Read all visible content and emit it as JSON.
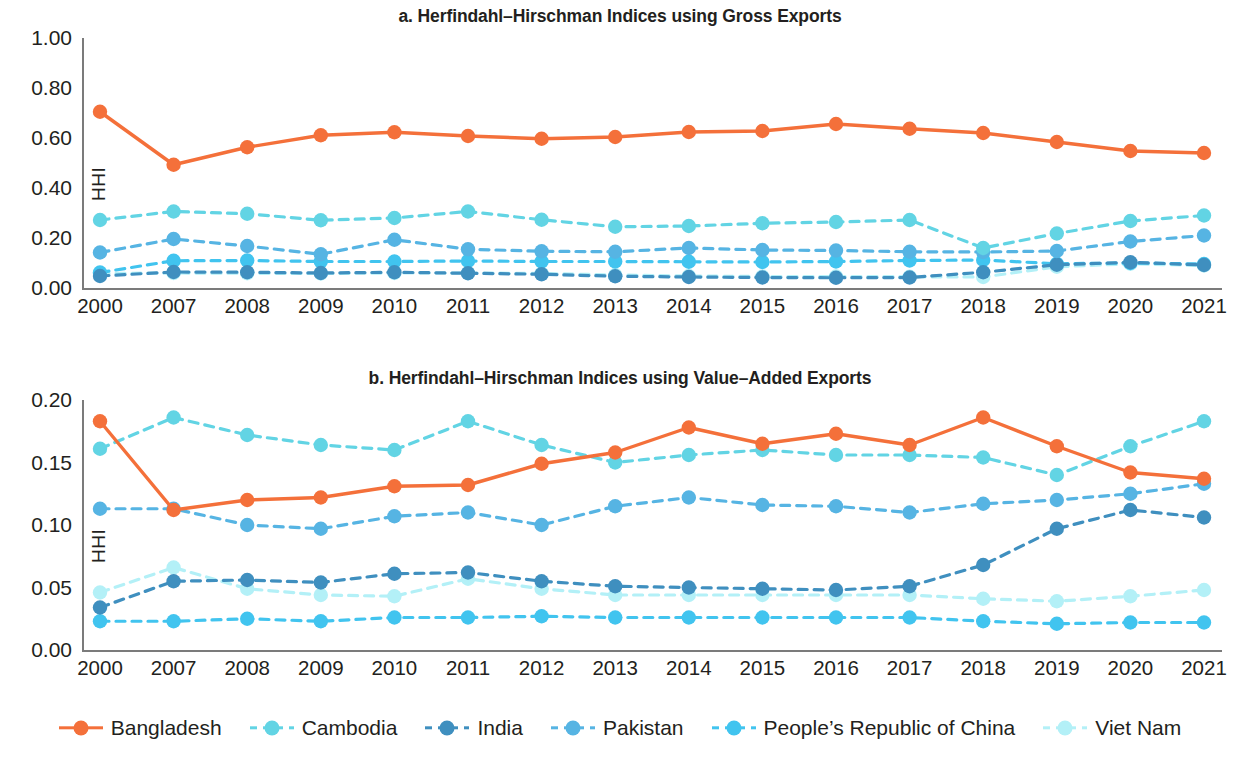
{
  "figure": {
    "ylabel": "HHI"
  },
  "legend": {
    "position": "bottom",
    "items": [
      {
        "label": "Bangladesh",
        "color": "#f4703a",
        "dashed": false
      },
      {
        "label": "Cambodia",
        "color": "#62d4e4",
        "dashed": true
      },
      {
        "label": "India",
        "color": "#3f8fbf",
        "dashed": true
      },
      {
        "label": "Pakistan",
        "color": "#56b4e3",
        "dashed": true
      },
      {
        "label": "People’s Republic of China",
        "color": "#41c4ef",
        "dashed": true
      },
      {
        "label": "Viet Nam",
        "color": "#b3f0f7",
        "dashed": true
      }
    ]
  },
  "chart_data": [
    {
      "id": "a",
      "type": "line",
      "title": "a. Herfindahl–Hirschman Indices using Gross Exports",
      "xlabel": "",
      "ylabel": "HHI",
      "grid": false,
      "ylim": [
        0.0,
        1.0
      ],
      "yticks": [
        "0.00",
        "0.20",
        "0.40",
        "0.60",
        "0.80",
        "1.00"
      ],
      "ytick_values": [
        0.0,
        0.2,
        0.4,
        0.6,
        0.8,
        1.0
      ],
      "categories": [
        "2000",
        "2007",
        "2008",
        "2009",
        "2010",
        "2011",
        "2012",
        "2013",
        "2014",
        "2015",
        "2016",
        "2017",
        "2018",
        "2019",
        "2020",
        "2021"
      ],
      "series": [
        {
          "name": "Bangladesh",
          "color": "#f4703a",
          "dashed": false,
          "values": [
            0.705,
            0.493,
            0.563,
            0.611,
            0.623,
            0.608,
            0.597,
            0.604,
            0.624,
            0.628,
            0.656,
            0.637,
            0.62,
            0.584,
            0.548,
            0.54
          ]
        },
        {
          "name": "Cambodia",
          "color": "#62d4e4",
          "dashed": true,
          "values": [
            0.272,
            0.306,
            0.297,
            0.271,
            0.28,
            0.306,
            0.273,
            0.245,
            0.248,
            0.259,
            0.264,
            0.272,
            0.16,
            0.218,
            0.268,
            0.29
          ]
        },
        {
          "name": "India",
          "color": "#3f8fbf",
          "dashed": true,
          "values": [
            0.048,
            0.064,
            0.063,
            0.06,
            0.063,
            0.059,
            0.055,
            0.047,
            0.044,
            0.042,
            0.041,
            0.042,
            0.063,
            0.093,
            0.103,
            0.092
          ]
        },
        {
          "name": "Pakistan",
          "color": "#56b4e3",
          "dashed": true,
          "values": [
            0.142,
            0.196,
            0.168,
            0.135,
            0.193,
            0.155,
            0.147,
            0.145,
            0.16,
            0.152,
            0.15,
            0.145,
            0.144,
            0.148,
            0.186,
            0.21
          ]
        },
        {
          "name": "People’s Republic of China",
          "color": "#41c4ef",
          "dashed": true,
          "values": [
            0.062,
            0.109,
            0.11,
            0.106,
            0.106,
            0.108,
            0.106,
            0.106,
            0.105,
            0.104,
            0.106,
            0.11,
            0.112,
            0.097,
            0.1,
            0.096
          ]
        },
        {
          "name": "Viet Nam",
          "color": "#b3f0f7",
          "dashed": true,
          "values": [
            0.058,
            0.06,
            0.059,
            0.058,
            0.06,
            0.06,
            0.058,
            0.052,
            0.048,
            0.046,
            0.046,
            0.045,
            0.044,
            0.085,
            0.097,
            0.09
          ]
        }
      ]
    },
    {
      "id": "b",
      "type": "line",
      "title": "b. Herfindahl–Hirschman Indices using Value–Added Exports",
      "xlabel": "",
      "ylabel": "HHI",
      "grid": false,
      "ylim": [
        0.0,
        0.2
      ],
      "yticks": [
        "0.00",
        "0.05",
        "0.10",
        "0.15",
        "0.20"
      ],
      "ytick_values": [
        0.0,
        0.05,
        0.1,
        0.15,
        0.2
      ],
      "categories": [
        "2000",
        "2007",
        "2008",
        "2009",
        "2010",
        "2011",
        "2012",
        "2013",
        "2014",
        "2015",
        "2016",
        "2017",
        "2018",
        "2019",
        "2020",
        "2021"
      ],
      "series": [
        {
          "name": "Bangladesh",
          "color": "#f4703a",
          "dashed": false,
          "values": [
            0.183,
            0.112,
            0.12,
            0.122,
            0.131,
            0.132,
            0.149,
            0.158,
            0.178,
            0.165,
            0.173,
            0.164,
            0.186,
            0.163,
            0.142,
            0.137
          ]
        },
        {
          "name": "Cambodia",
          "color": "#62d4e4",
          "dashed": true,
          "values": [
            0.161,
            0.186,
            0.172,
            0.164,
            0.16,
            0.183,
            0.164,
            0.15,
            0.156,
            0.16,
            0.156,
            0.156,
            0.154,
            0.14,
            0.163,
            0.183
          ]
        },
        {
          "name": "India",
          "color": "#3f8fbf",
          "dashed": true,
          "values": [
            0.034,
            0.055,
            0.056,
            0.054,
            0.061,
            0.062,
            0.055,
            0.051,
            0.05,
            0.049,
            0.048,
            0.051,
            0.068,
            0.097,
            0.112,
            0.106
          ]
        },
        {
          "name": "Pakistan",
          "color": "#56b4e3",
          "dashed": true,
          "values": [
            0.113,
            0.113,
            0.1,
            0.097,
            0.107,
            0.11,
            0.1,
            0.115,
            0.122,
            0.116,
            0.115,
            0.11,
            0.117,
            0.12,
            0.125,
            0.133
          ]
        },
        {
          "name": "People’s Republic of China",
          "color": "#41c4ef",
          "dashed": true,
          "values": [
            0.023,
            0.023,
            0.025,
            0.023,
            0.026,
            0.026,
            0.027,
            0.026,
            0.026,
            0.026,
            0.026,
            0.026,
            0.023,
            0.021,
            0.022,
            0.022
          ]
        },
        {
          "name": "Viet Nam",
          "color": "#b3f0f7",
          "dashed": true,
          "values": [
            0.046,
            0.066,
            0.049,
            0.044,
            0.043,
            0.057,
            0.049,
            0.044,
            0.044,
            0.044,
            0.044,
            0.044,
            0.041,
            0.039,
            0.043,
            0.048
          ]
        }
      ]
    }
  ]
}
